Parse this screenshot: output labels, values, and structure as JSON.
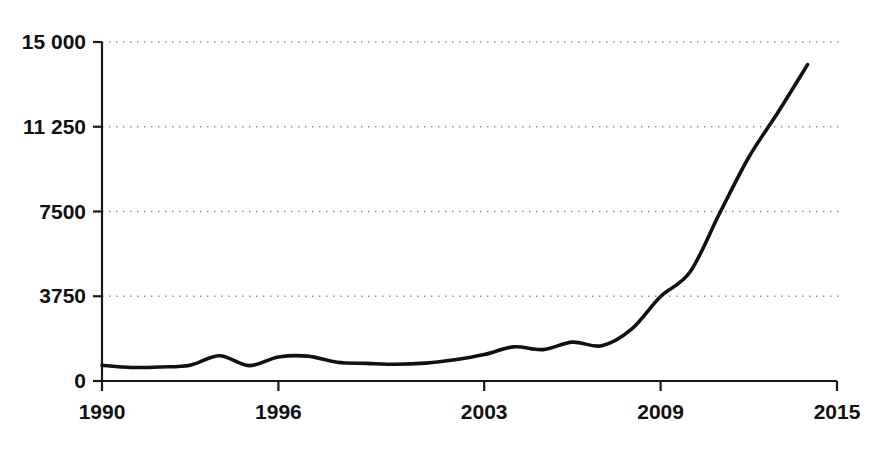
{
  "chart_data": {
    "type": "line",
    "title": "",
    "subtitle": "",
    "xlabel": "",
    "ylabel": "",
    "xlim": [
      1990,
      2015
    ],
    "ylim": [
      0,
      15000
    ],
    "grid": "horizontal-dotted",
    "legend": "none",
    "series": [
      {
        "name": "value",
        "color": "#111111",
        "x": [
          1990,
          1991,
          1992,
          1993,
          1994,
          1995,
          1996,
          1997,
          1998,
          1999,
          2000,
          2001,
          2002,
          2003,
          2004,
          2005,
          2006,
          2007,
          2008,
          2009,
          2010,
          2011,
          2012,
          2013,
          2014
        ],
        "values": [
          700,
          600,
          620,
          700,
          1120,
          680,
          1060,
          1100,
          830,
          780,
          740,
          790,
          940,
          1170,
          1510,
          1390,
          1720,
          1560,
          2280,
          3740,
          4820,
          7400,
          9900,
          11900,
          14000
        ]
      }
    ],
    "y_ticks": [
      {
        "value": 0,
        "label": "0"
      },
      {
        "value": 3750,
        "label": "3750"
      },
      {
        "value": 7500,
        "label": "7500"
      },
      {
        "value": 11250,
        "label": "11 250"
      },
      {
        "value": 15000,
        "label": "15 000"
      }
    ],
    "x_ticks": [
      {
        "value": 1990,
        "label": "1990"
      },
      {
        "value": 1996,
        "label": "1996"
      },
      {
        "value": 2003,
        "label": "2003"
      },
      {
        "value": 2009,
        "label": "2009"
      },
      {
        "value": 2015,
        "label": "2015"
      }
    ],
    "axis_color": "#1a1a1a",
    "gridline_color": "#8c8c8c",
    "background": "#ffffff"
  },
  "axes": {
    "y_tick_0": "0",
    "y_tick_1": "3750",
    "y_tick_2": "7500",
    "y_tick_3": "11 250",
    "y_tick_4": "15 000",
    "x_tick_0": "1990",
    "x_tick_1": "1996",
    "x_tick_2": "2003",
    "x_tick_3": "2009",
    "x_tick_4": "2015"
  }
}
